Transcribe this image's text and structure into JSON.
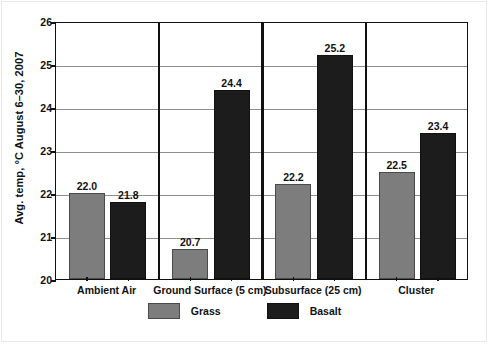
{
  "chart_data": {
    "type": "bar",
    "title": "",
    "subtitle": "",
    "xlabel": "",
    "ylabel": "Avg. temp, °C    August 6–30, 2007",
    "ylim": [
      20,
      26
    ],
    "yticks": [
      20,
      21,
      22,
      23,
      24,
      25,
      26
    ],
    "ytick_labels": [
      "20",
      "21",
      "22",
      "23",
      "24",
      "25",
      "26"
    ],
    "grid": true,
    "grid_axis": "y",
    "legend_position": "bottom-center",
    "categories": [
      "Ambient Air",
      "Ground Surface (5 cm)",
      "Subsurface (25 cm)",
      "Cluster"
    ],
    "series": [
      {
        "name": "Grass",
        "color": "#7d7d7d",
        "values": [
          22.0,
          20.7,
          22.2,
          22.5
        ],
        "labels": [
          "22.0",
          "20.7",
          "22.2",
          "22.5"
        ]
      },
      {
        "name": "Basalt",
        "color": "#1c1c1c",
        "values": [
          21.8,
          24.4,
          25.2,
          23.4
        ],
        "labels": [
          "21.8",
          "24.4",
          "25.2",
          "23.4"
        ]
      }
    ],
    "group_dividers": true,
    "units": "°C"
  },
  "legend": {
    "items": [
      {
        "label": "Grass",
        "color": "#7d7d7d"
      },
      {
        "label": "Basalt",
        "color": "#1c1c1c"
      }
    ]
  }
}
